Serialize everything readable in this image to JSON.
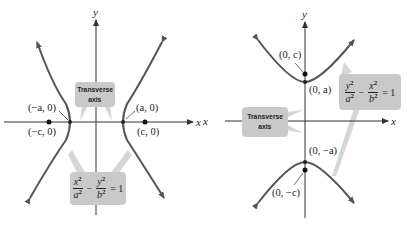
{
  "left_figure": {
    "axis_labels": {
      "x": "x",
      "y": "y"
    },
    "transverse_label": {
      "line1": "Transverse",
      "line2": "axis"
    },
    "points": {
      "neg_a": "(−a, 0)",
      "a": "(a, 0)",
      "neg_c": "(−c, 0)",
      "c": "(c, 0)"
    },
    "equation": {
      "term1_num": "x",
      "term1_den": "a",
      "term2_num": "y",
      "term2_den": "b",
      "exp": "2",
      "minus": "−",
      "rhs": "= 1"
    }
  },
  "right_figure": {
    "axis_labels": {
      "x": "x",
      "x_left": "x",
      "y": "y"
    },
    "transverse_label": {
      "line1": "Transverse",
      "line2": "axis"
    },
    "points": {
      "c": "(0, c)",
      "a": "(0, a)",
      "neg_a": "(0, −a)",
      "neg_c": "(0, −c)"
    },
    "equation": {
      "term1_num": "y",
      "term1_den": "a",
      "term2_num": "x",
      "term2_den": "b",
      "exp": "2",
      "minus": "−",
      "rhs": "= 1"
    }
  },
  "colors": {
    "curve": "#555555",
    "axis": "#333333",
    "callout_fill": "#c9c9c9",
    "pointer": "#d6d6d6"
  }
}
